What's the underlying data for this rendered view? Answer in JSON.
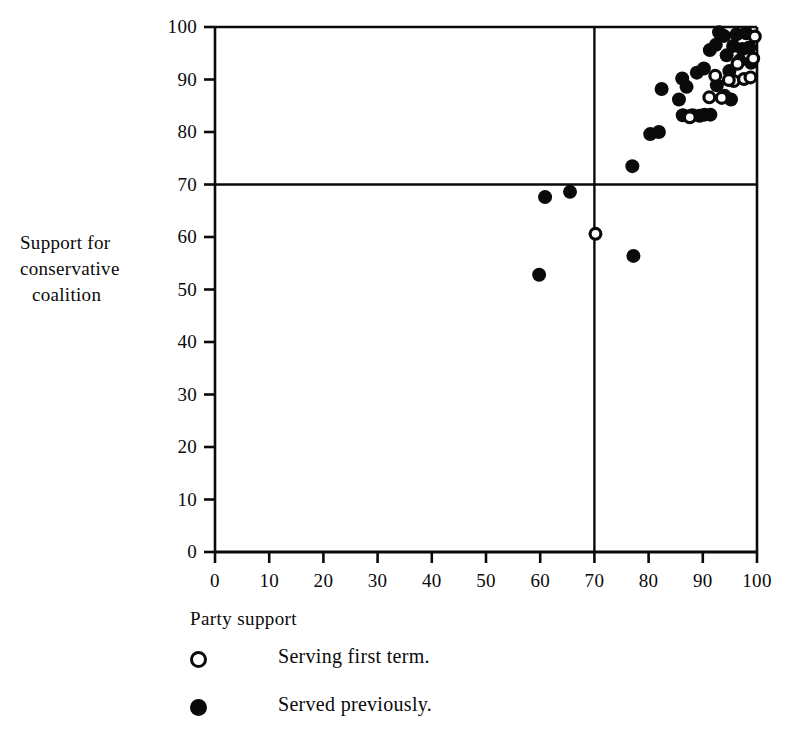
{
  "chart_data": {
    "type": "scatter",
    "title": "",
    "xlabel": "Party support",
    "ylabel": "Support for conservative coalition",
    "ylabel_lines": [
      "Support for",
      "conservative",
      "coalition"
    ],
    "xlim": [
      0,
      100
    ],
    "ylim": [
      0,
      100
    ],
    "xticks": [
      0,
      10,
      20,
      30,
      40,
      50,
      60,
      70,
      80,
      90,
      100
    ],
    "yticks": [
      0,
      10,
      20,
      30,
      40,
      50,
      60,
      70,
      80,
      90,
      100
    ],
    "xtick_labels": [
      "0",
      "10",
      "20",
      "30",
      "40",
      "50",
      "60",
      "70",
      "80",
      "90",
      "100"
    ],
    "ytick_labels": [
      "0",
      "10",
      "20",
      "30",
      "40",
      "50",
      "60",
      "70",
      "80",
      "90",
      "100"
    ],
    "grid": false,
    "reference_lines": [
      {
        "orientation": "vertical",
        "value": 70,
        "color": "#0a0a0a"
      },
      {
        "orientation": "horizontal",
        "value": 70,
        "color": "#0a0a0a"
      }
    ],
    "legend": {
      "position": "below-plot",
      "entries": [
        {
          "marker": "open-circle",
          "label": "Serving first term."
        },
        {
          "marker": "filled-circle",
          "label": "Served previously."
        }
      ]
    },
    "marker_colors": {
      "filled": "#0a0a0a",
      "open_edge": "#0a0a0a",
      "open_face": "#ffffff"
    },
    "marker_diameter_px": 14,
    "series": [
      {
        "name": "Served previously.",
        "marker": "filled-circle",
        "points": [
          [
            59.8,
            52.8
          ],
          [
            60.9,
            67.6
          ],
          [
            65.5,
            68.6
          ],
          [
            77.0,
            73.5
          ],
          [
            77.2,
            56.4
          ],
          [
            80.3,
            79.6
          ],
          [
            81.9,
            80.0
          ],
          [
            82.4,
            88.2
          ],
          [
            85.6,
            86.2
          ],
          [
            86.3,
            83.2
          ],
          [
            87.4,
            83.0
          ],
          [
            88.1,
            83.2
          ],
          [
            89.4,
            83.1
          ],
          [
            90.3,
            83.3
          ],
          [
            91.4,
            83.3
          ],
          [
            88.9,
            91.3
          ],
          [
            90.2,
            92.1
          ],
          [
            91.3,
            95.6
          ],
          [
            92.4,
            96.6
          ],
          [
            93.0,
            99.0
          ],
          [
            93.9,
            98.3
          ],
          [
            94.4,
            94.6
          ],
          [
            94.9,
            91.6
          ],
          [
            95.6,
            96.4
          ],
          [
            96.2,
            98.6
          ],
          [
            96.8,
            93.6
          ],
          [
            97.3,
            95.8
          ],
          [
            98.0,
            98.8
          ],
          [
            98.6,
            96.1
          ],
          [
            86.2,
            90.2
          ],
          [
            87.0,
            88.6
          ],
          [
            92.6,
            88.9
          ],
          [
            94.0,
            86.9
          ],
          [
            95.2,
            86.2
          ],
          [
            98.9,
            93.2
          ]
        ]
      },
      {
        "name": "Serving first term.",
        "marker": "open-circle",
        "points": [
          [
            70.2,
            60.6
          ],
          [
            87.6,
            82.8
          ],
          [
            91.2,
            86.6
          ],
          [
            93.5,
            86.5
          ],
          [
            95.7,
            89.7
          ],
          [
            96.4,
            93.0
          ],
          [
            97.6,
            90.1
          ],
          [
            98.8,
            90.4
          ],
          [
            99.3,
            94.0
          ],
          [
            99.6,
            98.2
          ],
          [
            92.3,
            90.7
          ],
          [
            94.8,
            89.9
          ]
        ]
      }
    ]
  }
}
